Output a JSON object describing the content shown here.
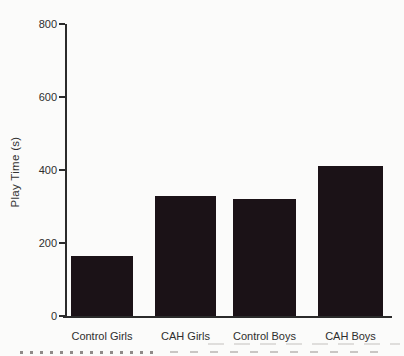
{
  "figure": {
    "ylabel": "Play Time (s)"
  },
  "chart_data": {
    "type": "bar",
    "categories": [
      "Control Girls",
      "CAH Girls",
      "Control Boys",
      "CAH Boys"
    ],
    "values": [
      165,
      330,
      320,
      410
    ],
    "title": "",
    "xlabel": "",
    "ylabel": "Play Time (s)",
    "ylim": [
      0,
      800
    ],
    "yticks": [
      0,
      200,
      400,
      600,
      800
    ],
    "grid": false,
    "legend": false,
    "bar_color": "#1b1217",
    "axis_color": "#2b2b2b",
    "text_color": "#2e2e2e",
    "background": "#fbfbfa"
  }
}
